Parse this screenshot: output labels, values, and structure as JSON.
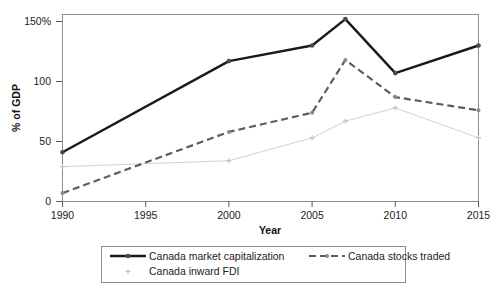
{
  "chart_data": {
    "type": "line",
    "title": "",
    "xlabel": "Year",
    "ylabel": "% of GDP",
    "x": [
      1990,
      2000,
      2005,
      2007,
      2010,
      2015
    ],
    "xticks": [
      1990,
      1995,
      2000,
      2005,
      2010,
      2015
    ],
    "xtick_labels": [
      "1990",
      "1995",
      "2000",
      "2005",
      "2010",
      "2015"
    ],
    "yticks": [
      0,
      50,
      100,
      150
    ],
    "ytick_labels": [
      "0",
      "50",
      "100",
      "150%"
    ],
    "xlim": [
      1990,
      2015
    ],
    "ylim": [
      0,
      157
    ],
    "grid": false,
    "legend_position": "bottom",
    "series": [
      {
        "name": "Canada market capitalization",
        "values": [
          41,
          117,
          130,
          152,
          107,
          130
        ],
        "color": "#1a1a1a",
        "style": "solid",
        "marker": "circle"
      },
      {
        "name": "Canada stocks traded",
        "values": [
          7,
          58,
          74,
          118,
          87,
          76
        ],
        "color": "#5e5e5e",
        "style": "dashed",
        "marker": "circle"
      },
      {
        "name": "Canada inward FDI",
        "values": [
          29,
          34,
          53,
          67,
          78,
          53
        ],
        "color": "#d2d2d2",
        "style": "solid",
        "marker": "plus"
      }
    ]
  },
  "axes": {
    "y_axis_title": "% of GDP",
    "x_axis_title": "Year",
    "ytick_0": "0",
    "ytick_1": "50",
    "ytick_2": "100",
    "ytick_3": "150%",
    "xtick_0": "1990",
    "xtick_1": "1995",
    "xtick_2": "2000",
    "xtick_3": "2005",
    "xtick_4": "2010",
    "xtick_5": "2015"
  },
  "legend": {
    "entry_0": "Canada market capitalization",
    "entry_1": "Canada stocks traded",
    "entry_2": "Canada inward FDI"
  }
}
